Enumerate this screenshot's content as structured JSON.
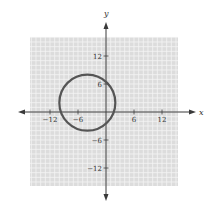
{
  "chart_data": {
    "type": "line",
    "title": "",
    "xlabel": "x",
    "ylabel": "y",
    "xlim": [
      -16,
      16
    ],
    "ylim": [
      -16,
      16
    ],
    "grid": true,
    "grid_step": 1,
    "x_ticks": [
      -12,
      -6,
      6,
      12
    ],
    "y_ticks": [
      12,
      6,
      -6,
      -12
    ],
    "x_tick_labels": [
      "−12",
      "−6",
      "6",
      "12"
    ],
    "y_tick_labels": [
      "12",
      "6",
      "−6",
      "−12"
    ],
    "series": [
      {
        "name": "circle",
        "shape": "circle",
        "center": [
          -4,
          2
        ],
        "radius": 6,
        "equation": "(x + 4)^2 + (y - 2)^2 = 36"
      }
    ],
    "colors": {
      "grid_background": "#dcdcdc",
      "grid_lines": "#f4f4f4",
      "axes": "#3a3a3a",
      "curve": "#555555"
    }
  }
}
